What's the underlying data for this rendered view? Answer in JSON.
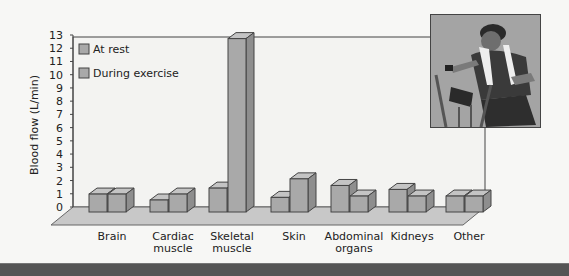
{
  "chart_data": {
    "type": "bar",
    "title": "",
    "xlabel": "",
    "ylabel": "Blood flow (L/min)",
    "ylim": [
      0,
      13
    ],
    "yticks": [
      0,
      1,
      2,
      3,
      4,
      5,
      6,
      7,
      8,
      9,
      10,
      11,
      12,
      13
    ],
    "grid": false,
    "legend_position": "top-left inside",
    "categories": [
      "Brain",
      "Cardiac muscle",
      "Skeletal muscle",
      "Skin",
      "Abdominal organs",
      "Kidneys",
      "Other"
    ],
    "category_lines": [
      [
        "Brain"
      ],
      [
        "Cardiac",
        "muscle"
      ],
      [
        "Skeletal",
        "muscle"
      ],
      [
        "Skin"
      ],
      [
        "Abdominal",
        "organs"
      ],
      [
        "Kidneys"
      ],
      [
        "Other"
      ]
    ],
    "series": [
      {
        "name": "At rest",
        "values": [
          0.75,
          0.25,
          1.2,
          0.5,
          1.4,
          1.1,
          0.6
        ]
      },
      {
        "name": "During exercise",
        "values": [
          0.75,
          0.75,
          12.5,
          1.9,
          0.6,
          0.6,
          0.6
        ]
      }
    ],
    "style": "3d",
    "colors": {
      "bar_front": "#a9a9a9",
      "bar_top": "#c4c4c4",
      "bar_side": "#8e8e8e",
      "floor": "#c8c8c8",
      "plot_bg": "#f3f3f1",
      "edge": "#444444"
    }
  },
  "legend": {
    "items": [
      {
        "label": "At rest"
      },
      {
        "label": "During exercise"
      }
    ]
  },
  "photo": {
    "description": "Woman exercising on a stationary bike with a towel around her neck"
  }
}
